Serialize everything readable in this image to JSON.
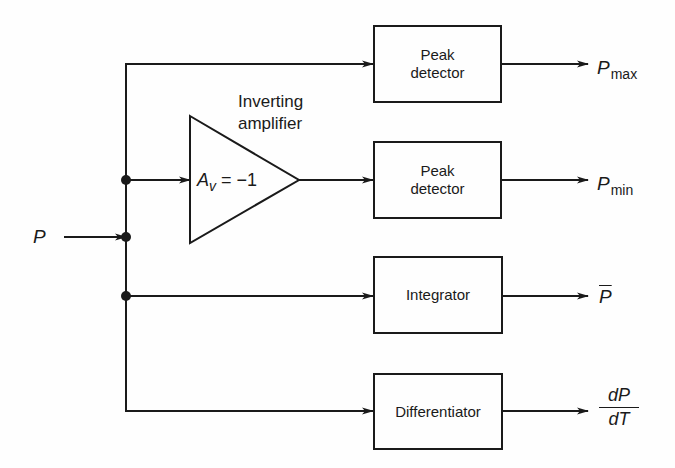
{
  "diagram": {
    "input_label": "P",
    "amplifier": {
      "title_line1": "Inverting",
      "title_line2": "amplifier",
      "gain_symbol": "A",
      "gain_subscript": "v",
      "gain_value": " = −1"
    },
    "blocks": [
      {
        "line1": "Peak",
        "line2": "detector"
      },
      {
        "line1": "Peak",
        "line2": "detector"
      },
      {
        "line1": "Integrator",
        "line2": ""
      },
      {
        "line1": "Differentiator",
        "line2": ""
      }
    ],
    "outputs": [
      {
        "symbol": "P",
        "subscript": "max"
      },
      {
        "symbol": "P",
        "subscript": "min"
      },
      {
        "symbol": "P",
        "decoration": "overbar"
      },
      {
        "numerator": "dP",
        "denominator": "dT"
      }
    ]
  }
}
